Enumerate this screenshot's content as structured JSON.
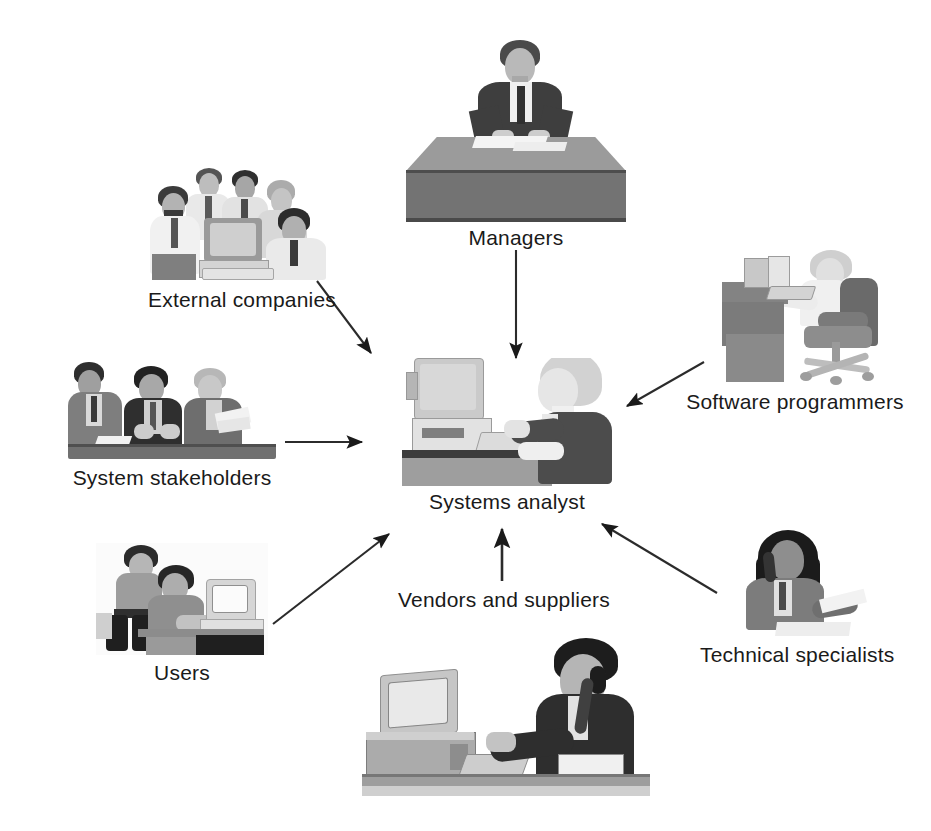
{
  "diagram": {
    "type": "hub-and-spoke",
    "background_color": "#ffffff",
    "ink_color": "#1a1a1a",
    "center": {
      "id": "systems-analyst",
      "label": "Systems analyst",
      "illustration": "woman working at desktop computer",
      "x": 505,
      "y": 435
    },
    "nodes": [
      {
        "id": "managers",
        "label": "Managers",
        "illustration": "man seated behind large desk",
        "x": 516,
        "y": 140,
        "label_x": 516,
        "label_y": 235
      },
      {
        "id": "external-companies",
        "label": "External companies",
        "illustration": "group of five business people around a computer",
        "x": 238,
        "y": 225,
        "label_x": 243,
        "label_y": 307
      },
      {
        "id": "system-stakeholders",
        "label": "System stakeholders",
        "illustration": "three people at a meeting table with documents",
        "x": 168,
        "y": 410,
        "label_x": 170,
        "label_y": 480
      },
      {
        "id": "users",
        "label": "Users",
        "illustration": "two people at a desktop computer terminal",
        "x": 180,
        "y": 600,
        "label_x": 184,
        "label_y": 665
      },
      {
        "id": "vendors-and-suppliers",
        "label": "Vendors and suppliers",
        "illustration": "man on telephone at computer workstation",
        "x": 500,
        "y": 745,
        "label_x": 504,
        "label_y": 601
      },
      {
        "id": "technical-specialists",
        "label": "Technical specialists",
        "illustration": "woman on telephone reading a document",
        "x": 790,
        "y": 585,
        "label_x": 793,
        "label_y": 657
      },
      {
        "id": "software-programmers",
        "label": "Software programmers",
        "illustration": "programmer seated in office chair at workstation",
        "x": 790,
        "y": 320,
        "label_x": 795,
        "label_y": 404
      }
    ],
    "arrows": [
      {
        "id": "arrow-managers-to-analyst",
        "from": "managers",
        "to": "systems-analyst",
        "x1": 516,
        "y1": 250,
        "x2": 516,
        "y2": 360,
        "direction": "down"
      },
      {
        "id": "arrow-external-companies-to-analyst",
        "from": "external-companies",
        "to": "systems-analyst",
        "x1": 317,
        "y1": 281,
        "x2": 372,
        "y2": 355,
        "direction": "down-right"
      },
      {
        "id": "arrow-system-stakeholders-to-analyst",
        "from": "system-stakeholders",
        "to": "systems-analyst",
        "x1": 285,
        "y1": 442,
        "x2": 364,
        "y2": 442,
        "direction": "right"
      },
      {
        "id": "arrow-users-to-analyst",
        "from": "users",
        "to": "systems-analyst",
        "x1": 273,
        "y1": 623,
        "x2": 390,
        "y2": 533,
        "direction": "up-right"
      },
      {
        "id": "arrow-vendors-to-analyst",
        "from": "vendors-and-suppliers",
        "to": "systems-analyst",
        "x1": 502,
        "y1": 580,
        "x2": 502,
        "y2": 529,
        "direction": "up"
      },
      {
        "id": "arrow-technical-specialists-to-analyst",
        "from": "technical-specialists",
        "to": "systems-analyst",
        "x1": 716,
        "y1": 592,
        "x2": 601,
        "y2": 523,
        "direction": "up-left"
      },
      {
        "id": "arrow-software-programmers-to-analyst",
        "from": "software-programmers",
        "to": "systems-analyst",
        "x1": 703,
        "y1": 363,
        "x2": 626,
        "y2": 407,
        "direction": "down-left"
      }
    ]
  },
  "palette": {
    "ink": "#1a1a1a",
    "background": "#ffffff",
    "tone_dark": "#3c3c3c",
    "tone_mid": "#8a8a8a",
    "tone_light": "#c9c9c9",
    "tone_pale": "#e4e4e4"
  }
}
